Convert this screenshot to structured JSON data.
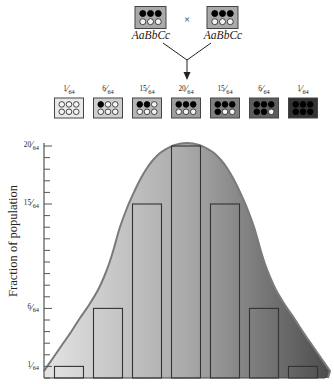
{
  "cross": {
    "cross_symbol": "×",
    "parents": [
      {
        "genotype": "AaBbCc",
        "filled_dots": 3,
        "total_dots": 6,
        "box_color": "#a9a9a9"
      },
      {
        "genotype": "AaBbCc",
        "filled_dots": 3,
        "total_dots": 6,
        "box_color": "#a9a9a9"
      }
    ]
  },
  "offspring_classes": [
    {
      "fraction": "1/64",
      "filled_dots": 0,
      "box_color": "#e9e9e9"
    },
    {
      "fraction": "6/64",
      "filled_dots": 1,
      "box_color": "#cfcfcf"
    },
    {
      "fraction": "15/64",
      "filled_dots": 2,
      "box_color": "#b6b6b6"
    },
    {
      "fraction": "20/64",
      "filled_dots": 3,
      "box_color": "#9d9d9d"
    },
    {
      "fraction": "15/64",
      "filled_dots": 4,
      "box_color": "#7f7f7f"
    },
    {
      "fraction": "6/64",
      "filled_dots": 5,
      "box_color": "#5d5d5d"
    },
    {
      "fraction": "1/64",
      "filled_dots": 6,
      "box_color": "#333333"
    }
  ],
  "chart_data": {
    "type": "bar",
    "title": "",
    "xlabel": "",
    "ylabel": "Fraction of population",
    "category_meaning": "number of filled (black) dots in the phenotype box above each bar",
    "categories": [
      0,
      1,
      2,
      3,
      4,
      5,
      6
    ],
    "values": [
      1,
      6,
      15,
      20,
      15,
      6,
      1
    ],
    "value_unit": "1/64",
    "value_labels": [
      "1/64",
      "6/64",
      "15/64",
      "20/64",
      "15/64",
      "6/64",
      "1/64"
    ],
    "yticks": [
      "1/64",
      "6/64",
      "15/64",
      "20/64"
    ],
    "minor_ticks_every": "1/64",
    "ylim": [
      0,
      20
    ],
    "grid": false,
    "legend": null,
    "overlay": "bell-shaped normal curve, fill shaded light gray (left) to dark gray (right)",
    "colors": {
      "curve_fill_left": "#e4e4e4",
      "curve_fill_mid": "#a9a9a9",
      "curve_fill_right": "#4c4c4c",
      "curve_stroke": "#7a7a7a",
      "bar_outline": "#333333"
    }
  }
}
